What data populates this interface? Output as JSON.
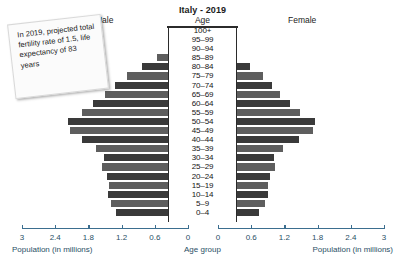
{
  "header": {
    "title": "Italy - 2019",
    "age_heading": "Age",
    "male_label": "Male",
    "female_label": "Female"
  },
  "annotation": {
    "text": "In 2019, projected total fertility rate of 1.5, life expectancy of 83 years"
  },
  "axis": {
    "left_title": "Population (in millions)",
    "center_title": "Age group",
    "right_title": "Population (in millions)",
    "left_ticks": [
      "3",
      "2.4",
      "1.8",
      "1.2",
      "0.6",
      "0"
    ],
    "right_ticks": [
      "0",
      "0.6",
      "1.2",
      "1.8",
      "2.4",
      "3"
    ]
  },
  "colors": {
    "bar_dark": "#3a3a3a",
    "bar_mid": "#5e5e5e",
    "axis": "#3b6e8f",
    "axis_text": "#2a4f66",
    "note_bg": "#fbfbfb"
  },
  "chart_data": {
    "type": "bar",
    "subtype": "population-pyramid",
    "title": "Italy - 2019",
    "xlabel": "Population (in millions)",
    "ylabel": "Age group",
    "xlim": [
      0,
      3
    ],
    "xticks": [
      0,
      0.6,
      1.2,
      1.8,
      2.4,
      3
    ],
    "grid": false,
    "legend": [
      "Male",
      "Female"
    ],
    "legend_position": "top",
    "categories": [
      "100+",
      "95–99",
      "90–94",
      "85–89",
      "80–84",
      "75–79",
      "70–74",
      "65–69",
      "60–64",
      "55–59",
      "50–54",
      "45–49",
      "40–44",
      "35–39",
      "30–34",
      "25–29",
      "20–24",
      "15–19",
      "10–14",
      "5–9",
      "0–4"
    ],
    "series": [
      {
        "name": "Male",
        "side": "left",
        "values": [
          0.02,
          0.12,
          0.3,
          0.56,
          0.83,
          1.1,
          1.32,
          1.5,
          1.72,
          1.92,
          2.16,
          2.14,
          1.92,
          1.66,
          1.52,
          1.55,
          1.46,
          1.43,
          1.45,
          1.4,
          1.31
        ]
      },
      {
        "name": "Female",
        "side": "right",
        "values": [
          0.04,
          0.22,
          0.52,
          0.82,
          1.12,
          1.35,
          1.52,
          1.66,
          1.84,
          2.02,
          2.3,
          2.26,
          2.0,
          1.72,
          1.55,
          1.57,
          1.48,
          1.44,
          1.45,
          1.39,
          1.29
        ]
      }
    ]
  }
}
